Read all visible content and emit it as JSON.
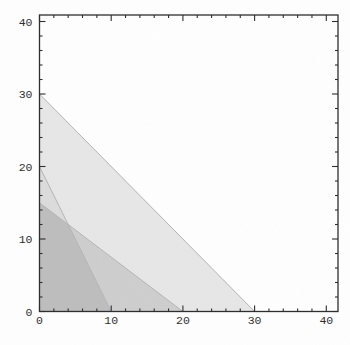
{
  "chart_data": {
    "type": "area",
    "title": "",
    "xlabel": "",
    "ylabel": "",
    "xlim": [
      0,
      41.6
    ],
    "ylim": [
      0,
      40.9
    ],
    "grid": false,
    "frame": true,
    "x_ticks": {
      "major": [
        0,
        10,
        20,
        30,
        40
      ],
      "labels": [
        "0",
        "10",
        "20",
        "30",
        "40"
      ],
      "minor_step": 2
    },
    "y_ticks": {
      "major": [
        0,
        10,
        20,
        30,
        40
      ],
      "labels": [
        "0",
        "10",
        "20",
        "30",
        "40"
      ],
      "minor_step": 2
    },
    "constraints": [
      {
        "name": "constraint-a",
        "line": [
          [
            0,
            30
          ],
          [
            30,
            0
          ]
        ],
        "x_intercept": 30,
        "y_intercept": 30
      },
      {
        "name": "constraint-b",
        "line": [
          [
            0,
            15
          ],
          [
            20,
            0
          ]
        ],
        "x_intercept": 20,
        "y_intercept": 15
      },
      {
        "name": "constraint-c",
        "line": [
          [
            0,
            20
          ],
          [
            10,
            0
          ]
        ],
        "x_intercept": 10,
        "y_intercept": 20
      }
    ],
    "regions": [
      {
        "name": "overlap-1",
        "overlap_level": 1,
        "fill": "#e7e7e7",
        "polygon": [
          [
            0,
            30
          ],
          [
            0,
            20
          ],
          [
            4,
            12
          ],
          [
            20,
            0
          ],
          [
            30,
            0
          ]
        ]
      },
      {
        "name": "overlap-2-upper",
        "overlap_level": 2,
        "fill": "#dcdcdc",
        "polygon": [
          [
            0,
            20
          ],
          [
            0,
            15
          ],
          [
            4,
            12
          ]
        ]
      },
      {
        "name": "overlap-2-lower",
        "overlap_level": 2,
        "fill": "#cecece",
        "polygon": [
          [
            4,
            12
          ],
          [
            20,
            0
          ],
          [
            10,
            0
          ]
        ]
      },
      {
        "name": "feasible-region",
        "overlap_level": 3,
        "fill": "#bdbdbd",
        "polygon": [
          [
            0,
            15
          ],
          [
            4,
            12
          ],
          [
            10,
            0
          ],
          [
            0,
            0
          ]
        ]
      }
    ],
    "feasible_vertices": [
      [
        0,
        0
      ],
      [
        10,
        0
      ],
      [
        4,
        12
      ],
      [
        0,
        15
      ]
    ],
    "colors": {
      "frame": "#2b2b2b",
      "boundary": "#b4b4b4",
      "background": "#ffffff",
      "label": "#2b2b2b"
    }
  }
}
